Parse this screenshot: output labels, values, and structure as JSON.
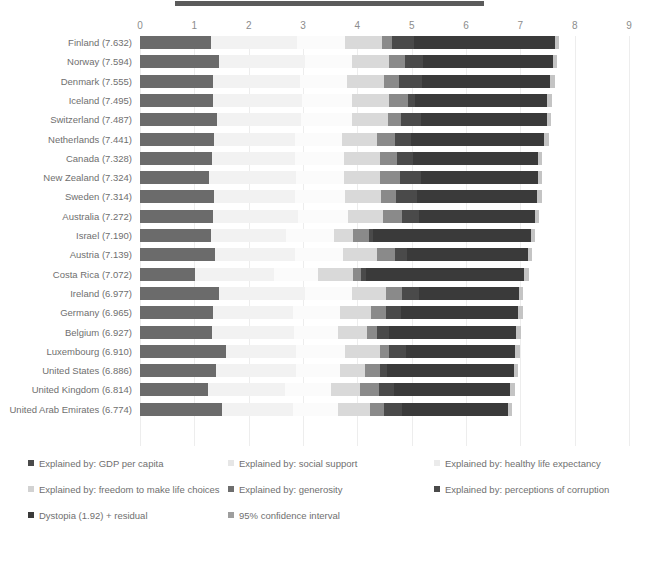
{
  "chart_data": {
    "type": "bar",
    "title": "",
    "subtitle": "",
    "xlabel": "",
    "ylabel": "",
    "orientation": "horizontal",
    "stacked": true,
    "xlim": [
      0,
      9
    ],
    "xticks": [
      "0",
      "1",
      "2",
      "3",
      "4",
      "5",
      "6",
      "7",
      "8",
      "9"
    ],
    "grid": true,
    "legend_position": "bottom",
    "categories": [
      "Finland (7.632)",
      "Norway (7.594)",
      "Denmark (7.555)",
      "Iceland (7.495)",
      "Switzerland (7.487)",
      "Netherlands (7.441)",
      "Canada (7.328)",
      "New Zealand (7.324)",
      "Sweden (7.314)",
      "Australia (7.272)",
      "Israel (7.190)",
      "Austria (7.139)",
      "Costa Rica (7.072)",
      "Ireland (6.977)",
      "Germany (6.965)",
      "Belgium (6.927)",
      "Luxembourg (6.910)",
      "United States (6.886)",
      "United Kingdom (6.814)",
      "United Arab Emirates (6.774)"
    ],
    "series": [
      {
        "name": "Explained by: GDP per capita",
        "color": "#6b6b6b",
        "values": [
          1.305,
          1.456,
          1.351,
          1.343,
          1.42,
          1.361,
          1.33,
          1.269,
          1.355,
          1.34,
          1.301,
          1.376,
          1.011,
          1.448,
          1.341,
          1.324,
          1.576,
          1.398,
          1.244,
          1.503
        ]
      },
      {
        "name": "Explained by: social support",
        "color": "#f2f2f2",
        "values": [
          1.592,
          1.582,
          1.59,
          1.644,
          1.549,
          1.488,
          1.532,
          1.601,
          1.501,
          1.573,
          1.392,
          1.475,
          1.459,
          1.583,
          1.472,
          1.503,
          1.302,
          1.471,
          1.433,
          1.31
        ]
      },
      {
        "name": "Explained by: healthy life expectancy",
        "color": "#fbfbfb",
        "values": [
          0.874,
          0.861,
          0.868,
          0.914,
          0.927,
          0.878,
          0.896,
          0.876,
          0.913,
          0.91,
          0.869,
          0.888,
          0.815,
          0.876,
          0.861,
          0.825,
          0.897,
          0.819,
          0.836,
          0.825
        ]
      },
      {
        "name": "Explained by: freedom to make life choices",
        "color": "#d9d9d9",
        "values": [
          0.681,
          0.686,
          0.683,
          0.677,
          0.66,
          0.638,
          0.653,
          0.669,
          0.659,
          0.647,
          0.365,
          0.619,
          0.632,
          0.614,
          0.586,
          0.531,
          0.639,
          0.454,
          0.537,
          0.598
        ]
      },
      {
        "name": "Explained by: generosity",
        "color": "#8a8a8a",
        "values": [
          0.192,
          0.286,
          0.284,
          0.353,
          0.256,
          0.333,
          0.321,
          0.365,
          0.285,
          0.361,
          0.285,
          0.332,
          0.143,
          0.307,
          0.273,
          0.188,
          0.175,
          0.28,
          0.348,
          0.262
        ]
      },
      {
        "name": "Explained by: perceptions of corruption",
        "color": "#4a4a4a",
        "values": [
          0.393,
          0.34,
          0.408,
          0.138,
          0.357,
          0.295,
          0.291,
          0.389,
          0.383,
          0.302,
          0.082,
          0.226,
          0.097,
          0.307,
          0.265,
          0.206,
          0.316,
          0.128,
          0.278,
          0.316
        ]
      },
      {
        "name": "Dystopia (1.92) + residual",
        "color": "#3a3a3a",
        "values": [
          2.595,
          2.383,
          2.371,
          2.426,
          2.318,
          2.448,
          2.305,
          2.155,
          2.218,
          2.139,
          2.896,
          2.223,
          2.915,
          1.842,
          2.167,
          2.35,
          2.005,
          2.336,
          2.138,
          1.96
        ]
      },
      {
        "name": "95% confidence interval",
        "color": "#c4c4c4",
        "values": [
          0.08,
          0.08,
          0.08,
          0.08,
          0.08,
          0.08,
          0.08,
          0.08,
          0.08,
          0.08,
          0.08,
          0.08,
          0.08,
          0.08,
          0.08,
          0.08,
          0.08,
          0.08,
          0.08,
          0.08
        ]
      }
    ]
  },
  "legend": {
    "items": [
      {
        "label": "Explained by: GDP per capita",
        "color": "#4a4a4a",
        "col": 0,
        "rowi": 0
      },
      {
        "label": "Explained by: social support",
        "color": "#e6e6e6",
        "col": 1,
        "rowi": 0
      },
      {
        "label": "Explained by: healthy life expectancy",
        "color": "#ebebeb",
        "col": 2,
        "rowi": 0
      },
      {
        "label": "Explained by: freedom to make life choices",
        "color": "#d2d2d2",
        "col": 0,
        "rowi": 1
      },
      {
        "label": "Explained by: generosity",
        "color": "#6e6e6e",
        "col": 1,
        "rowi": 1
      },
      {
        "label": "Explained by: perceptions of corruption",
        "color": "#4a4a4a",
        "col": 2,
        "rowi": 1
      },
      {
        "label": "Dystopia (1.92) + residual",
        "color": "#3a3a3a",
        "col": 0,
        "rowi": 2
      },
      {
        "label": "95% confidence interval",
        "color": "#9e9e9e",
        "col": 1,
        "rowi": 2
      }
    ]
  }
}
